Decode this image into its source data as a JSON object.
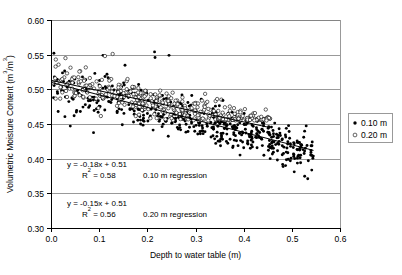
{
  "chart_data": {
    "type": "scatter",
    "title": "",
    "xlabel": "Depth to water table (m)",
    "ylabel": "Volumetric Moisture Content (m3/m3)",
    "ylabel_parts": {
      "main": "Volumetric Moisture Content (m",
      "sup1": "3",
      "mid": "/m",
      "sup2": "3",
      "end": ")"
    },
    "xlim": [
      0.0,
      0.6
    ],
    "ylim": [
      0.3,
      0.6
    ],
    "xticks": [
      "0.0",
      "0.1",
      "0.2",
      "0.3",
      "0.4",
      "0.5",
      "0.6"
    ],
    "xtick_values": [
      0.0,
      0.1,
      0.2,
      0.3,
      0.4,
      0.5,
      0.6
    ],
    "yticks": [
      "0.60",
      "0.55",
      "0.50",
      "0.45",
      "0.40",
      "0.35",
      "0.30"
    ],
    "ytick_values": [
      0.6,
      0.55,
      0.5,
      0.45,
      0.4,
      0.35,
      0.3
    ],
    "grid": "horizontal",
    "legend_position": "right",
    "legend": [
      {
        "label": "0.10 m",
        "marker": "filled-circle"
      },
      {
        "label": "0.20 m",
        "marker": "open-circle"
      }
    ],
    "series": [
      {
        "name": "0.10 m",
        "marker": "filled-circle",
        "color": "#000000",
        "n_points": 520,
        "x_range": [
          0.005,
          0.545
        ],
        "y_range": [
          0.37,
          0.553
        ],
        "trend_slope": -0.18,
        "trend_intercept": 0.51,
        "scatter_sd": 0.014
      },
      {
        "name": "0.20 m",
        "marker": "open-circle",
        "color": "#000000",
        "n_points": 360,
        "x_range": [
          0.004,
          0.455
        ],
        "y_range": [
          0.455,
          0.551
        ],
        "trend_slope": -0.15,
        "trend_intercept": 0.513,
        "scatter_sd": 0.011
      }
    ],
    "regressions": [
      {
        "name": "0.10 m regression",
        "equation": "y = -0.18x + 0.51",
        "r2_label": "R2 = 0.58",
        "r2_prefix": "R",
        "r2_sup": "2",
        "r2_suffix": " = 0.58",
        "slope": -0.18,
        "intercept": 0.51,
        "r2": 0.58,
        "x_start": 0.0,
        "x_end": 0.545
      },
      {
        "name": "0.20 m regression",
        "equation": "y = -0.15x + 0.51",
        "r2_label": "R2 = 0.56",
        "r2_prefix": "R",
        "r2_sup": "2",
        "r2_suffix": " = 0.56",
        "slope": -0.15,
        "intercept": 0.513,
        "r2": 0.56,
        "x_start": 0.0,
        "x_end": 0.455
      }
    ],
    "annotations": [
      {
        "id": "annotation-010",
        "equation": "y = -0.18x + 0.51",
        "r2_prefix": "R",
        "r2_sup": "2",
        "r2_suffix": " = 0.58",
        "caption": "0.10 m regression"
      },
      {
        "id": "annotation-020",
        "equation": "y = -0.15x + 0.51",
        "r2_prefix": "R",
        "r2_sup": "2",
        "r2_suffix": " = 0.56",
        "caption": "0.20 m regression"
      }
    ],
    "colors": {
      "axis": "#000000",
      "grid": "#808080",
      "marker": "#000000",
      "background": "#ffffff"
    }
  }
}
